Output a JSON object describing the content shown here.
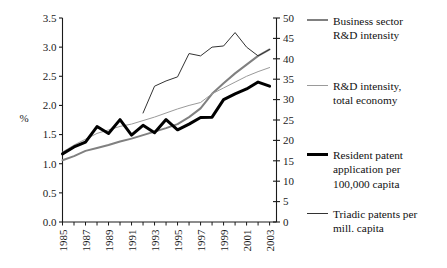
{
  "chart_data": {
    "type": "line",
    "title": "",
    "subtitle": "",
    "xlabel": "",
    "ylabel": "%",
    "ylabel_right": "",
    "x": [
      1985,
      1986,
      1987,
      1988,
      1989,
      1990,
      1991,
      1992,
      1993,
      1994,
      1995,
      1996,
      1997,
      1998,
      1999,
      2000,
      2001,
      2002,
      2003
    ],
    "xlim": [
      1985,
      2003.6
    ],
    "ylim": [
      0.0,
      3.5
    ],
    "ylim_right": [
      0,
      50
    ],
    "grid": false,
    "legend_position": "right",
    "yticks": [
      "0.0",
      "0.5",
      "1.0",
      "1.5",
      "2.0",
      "2.5",
      "3.0",
      "3.5"
    ],
    "ytick_values": [
      0.0,
      0.5,
      1.0,
      1.5,
      2.0,
      2.5,
      3.0,
      3.5
    ],
    "yticks_right": [
      "0",
      "5",
      "10",
      "15",
      "20",
      "25",
      "30",
      "35",
      "40",
      "45",
      "50"
    ],
    "ytick_values_right": [
      0,
      5,
      10,
      15,
      20,
      25,
      30,
      35,
      40,
      45,
      50
    ],
    "xticks": [
      "1985",
      "1987",
      "1989",
      "1991",
      "1993",
      "1995",
      "1997",
      "1999",
      "2001",
      "2003"
    ],
    "xtick_values": [
      1985,
      1987,
      1989,
      1991,
      1993,
      1995,
      1997,
      1999,
      2001,
      2003
    ],
    "series": [
      {
        "name": "Business sector R&D intensity",
        "axis": "left",
        "color": "#808080",
        "width": 2.0,
        "x": [
          1985,
          1986,
          1987,
          1988,
          1989,
          1990,
          1991,
          1992,
          1993,
          1994,
          1995,
          1996,
          1997,
          1998,
          1999,
          2000,
          2001,
          2002,
          2003
        ],
        "values": [
          1.06,
          1.13,
          1.22,
          1.27,
          1.32,
          1.38,
          1.43,
          1.49,
          1.55,
          1.61,
          1.68,
          1.8,
          1.95,
          2.2,
          2.38,
          2.55,
          2.7,
          2.85,
          2.96
        ]
      },
      {
        "name": "R&D intensity, total economy",
        "axis": "left",
        "color": "#9a9a9a",
        "width": 1.0,
        "x": [
          1985,
          1986,
          1987,
          1988,
          1989,
          1990,
          1991,
          1992,
          1993,
          1994,
          1995,
          1996,
          1997,
          1998,
          1999,
          2000,
          2001,
          2002,
          2003
        ],
        "values": [
          1.2,
          1.32,
          1.42,
          1.52,
          1.58,
          1.64,
          1.68,
          1.74,
          1.8,
          1.87,
          1.94,
          2.0,
          2.05,
          2.2,
          2.3,
          2.4,
          2.5,
          2.58,
          2.65
        ]
      },
      {
        "name": "Resident patent application per 100,000 capita",
        "axis": "right",
        "color": "#000000",
        "width": 3.0,
        "x": [
          1985,
          1986,
          1987,
          1988,
          1989,
          1990,
          1991,
          1992,
          1993,
          1994,
          1995,
          1996,
          1997,
          1998,
          1999,
          2000,
          2001,
          2002,
          2003
        ],
        "values": [
          16.7,
          18.4,
          19.6,
          23.4,
          21.7,
          25.1,
          21.3,
          23.7,
          21.9,
          25.1,
          22.6,
          24.0,
          25.6,
          25.7,
          30.0,
          31.4,
          32.6,
          34.3,
          33.3
        ]
      },
      {
        "name": "Triadic patents per mill. capita",
        "axis": "left",
        "color": "#333333",
        "width": 1.0,
        "x": [
          1992,
          1993,
          1994,
          1995,
          1996,
          1997,
          1998,
          1999,
          2000,
          2001,
          2002,
          2003
        ],
        "values": [
          1.87,
          2.33,
          2.42,
          2.49,
          2.89,
          2.85,
          3.0,
          3.02,
          3.25,
          3.0,
          2.85,
          2.96
        ]
      }
    ]
  },
  "axes": {
    "ylabel_left": "%"
  },
  "legend": {
    "items": [
      {
        "key": "business-sector",
        "lines": [
          "Business sector",
          "R&D intensity"
        ],
        "color": "#808080",
        "width": 2.0
      },
      {
        "key": "total-economy",
        "lines": [
          "R&D intensity,",
          "total economy"
        ],
        "color": "#9a9a9a",
        "width": 1.0
      },
      {
        "key": "resident-patent",
        "lines": [
          "Resident patent",
          "application per",
          "100,000 capita"
        ],
        "color": "#000000",
        "width": 3.0
      },
      {
        "key": "triadic-patents",
        "lines": [
          "Triadic patents per",
          "mill. capita"
        ],
        "color": "#333333",
        "width": 1.0
      }
    ]
  }
}
